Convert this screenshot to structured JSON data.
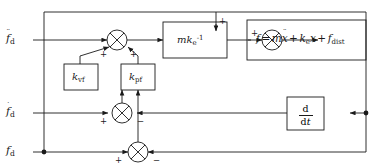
{
  "diagram": {
    "type": "control-block-diagram",
    "inputs": [
      {
        "id": "fdd",
        "base": "f",
        "dots": "¨",
        "subscript": "d"
      },
      {
        "id": "fd1",
        "base": "f",
        "dots": "˙",
        "subscript": "d"
      },
      {
        "id": "fd0",
        "base": "f",
        "dots": "",
        "subscript": "d"
      }
    ],
    "blocks": {
      "gain_mk": {
        "label_main": "mk",
        "label_sub": "e",
        "label_sup": "-1"
      },
      "gain_vf": {
        "label_main": "k",
        "label_sub": "vf"
      },
      "gain_pf": {
        "label_main": "k",
        "label_sub": "pf"
      },
      "derivative": {
        "numerator": "d",
        "denominator_d": "d",
        "denominator_t": "t"
      },
      "plant": {
        "lhs": "f",
        "eq": "=",
        "term1_coef": "m",
        "term1_var": "x",
        "term1_dots": "¨",
        "plus1": "+",
        "term2_coef": "k",
        "term2_sub": "e",
        "term2_var": "x",
        "plus2": "+",
        "term3_var": "f",
        "term3_sub": "dist"
      }
    },
    "junctions": [
      {
        "id": "sum-accel",
        "signs": [
          "+",
          "+"
        ]
      },
      {
        "id": "sum-command",
        "signs": [
          "+",
          "+"
        ]
      },
      {
        "id": "sum-vel",
        "signs": [
          "+",
          "−"
        ]
      },
      {
        "id": "sum-pos",
        "signs": [
          "+",
          "−"
        ]
      }
    ],
    "signs": {
      "plus": "+",
      "minus": "−"
    },
    "colors": {
      "line": "#1a1a1a",
      "text": "#1a1a1a",
      "background": "#ffffff"
    }
  }
}
